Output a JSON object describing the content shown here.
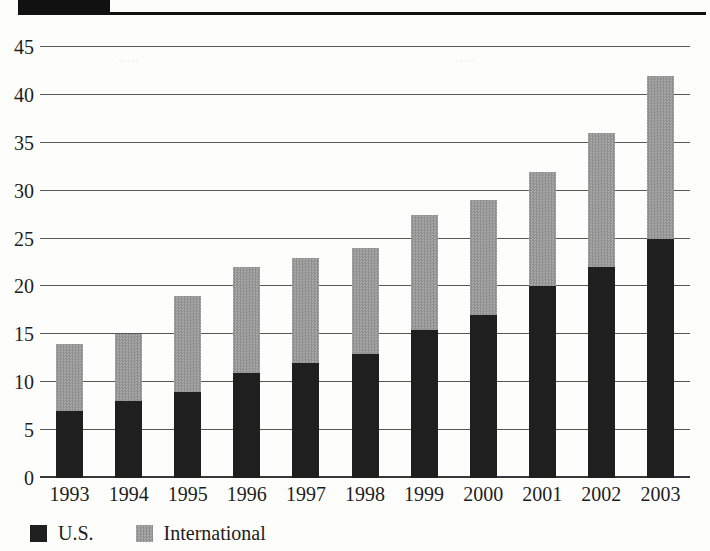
{
  "header": {
    "title_block_text": "",
    "rule": true
  },
  "chart_data": {
    "type": "bar",
    "subtype": "stacked-vertical",
    "title": "",
    "xlabel": "",
    "ylabel": "",
    "ylim": [
      0,
      45
    ],
    "ytick_step": 5,
    "grid": true,
    "legend_position": "bottom-left",
    "categories": [
      "1993",
      "1994",
      "1995",
      "1996",
      "1997",
      "1998",
      "1999",
      "2000",
      "2001",
      "2002",
      "2003"
    ],
    "ytick_labels": [
      "45",
      "40",
      "35",
      "30",
      "25",
      "20",
      "15",
      "10",
      "5",
      "0"
    ],
    "series": [
      {
        "name": "U.S.",
        "color": "#1f1f1f",
        "values": [
          7,
          8,
          9,
          11,
          12,
          13,
          15.5,
          17,
          20,
          22,
          25
        ]
      },
      {
        "name": "International",
        "color": "#9a9a9a",
        "values": [
          7,
          7,
          10,
          11,
          11,
          11,
          12,
          12,
          12,
          14,
          17
        ]
      }
    ],
    "totals": [
      14,
      15,
      19,
      22,
      23,
      24,
      27.5,
      29,
      32,
      36,
      42
    ]
  },
  "legend": {
    "items": [
      {
        "label": "U.S.",
        "color": "#1f1f1f"
      },
      {
        "label": "International",
        "color": "#9a9a9a"
      }
    ]
  }
}
